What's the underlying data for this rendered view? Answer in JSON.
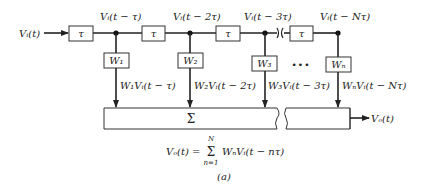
{
  "diagram": {
    "input_label": "Vᵢ(t)",
    "delay_symbol": "τ",
    "tap_labels": [
      "Vᵢ(t − τ)",
      "Vᵢ(t − 2τ)",
      "Vᵢ(t − 3τ)",
      "Vᵢ(t − Nτ)"
    ],
    "weights": [
      "W₁",
      "W₂",
      "W₃",
      "Wₙ"
    ],
    "weighted_outputs": [
      "W₁Vᵢ(t − τ)",
      "W₂Vᵢ(t − 2τ)",
      "W₃Vᵢ(t − 3τ)",
      "WₙVᵢ(t − Nτ)"
    ],
    "ellipsis": "•••",
    "summer_symbol": "Σ",
    "output_label": "Vₒ(t)",
    "equation": {
      "lhs": "Vₒ(t) =",
      "sum_upper": "N",
      "sum_symbol": "Σ",
      "sum_lower": "n=1",
      "rhs": "WₙVᵢ(t − nτ)"
    },
    "caption": "(a)"
  }
}
